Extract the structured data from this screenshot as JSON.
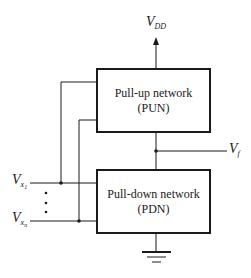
{
  "diagram": {
    "supply": {
      "label": "V",
      "subscript": "DD"
    },
    "output": {
      "label": "V",
      "subscript": "f"
    },
    "inputs": [
      {
        "label": "V",
        "subscript": "x",
        "subsub": "1"
      },
      {
        "label": "V",
        "subscript": "x",
        "subsub": "n"
      }
    ],
    "ellipsis": "⋮",
    "pull_up": {
      "line1": "Pull-up network",
      "line2": "(PUN)"
    },
    "pull_down": {
      "line1": "Pull-down network",
      "line2": "(PDN)"
    },
    "ground": "ground-symbol",
    "colors": {
      "line": "#1a1a1a",
      "background": "#ffffff"
    }
  }
}
